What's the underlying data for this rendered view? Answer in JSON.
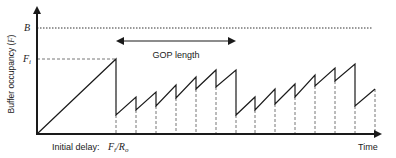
{
  "axes": {
    "y_label": "Buffer occupancy (F)",
    "x_label": "Time",
    "y_levels": [
      {
        "label": "B",
        "y": 28,
        "style": "dotted"
      },
      {
        "label": "Fi",
        "y": 59,
        "style": "dashed"
      }
    ]
  },
  "annotations": {
    "gop_label": "GOP length",
    "initial_delay_label": "Initial delay:",
    "initial_delay_value": "Fi/Ro"
  },
  "colors": {
    "line": "#1a1a1a",
    "dashed": "#777777",
    "text": "#222222"
  },
  "diagram": {
    "origin": [
      37,
      134
    ],
    "x_axis_end": 384,
    "y_axis_top": 5,
    "markers_x": [
      116,
      136,
      156,
      176,
      196,
      216,
      236,
      255,
      275,
      295,
      315,
      335,
      355,
      375
    ],
    "curve_points": [
      [
        37,
        134
      ],
      [
        116,
        59
      ],
      [
        116,
        115
      ],
      [
        136,
        97
      ],
      [
        136,
        110
      ],
      [
        156,
        92
      ],
      [
        156,
        106
      ],
      [
        176,
        85
      ],
      [
        176,
        98
      ],
      [
        196,
        77
      ],
      [
        196,
        89
      ],
      [
        216,
        70
      ],
      [
        216,
        87
      ],
      [
        236,
        70
      ],
      [
        236,
        115
      ],
      [
        255,
        97
      ],
      [
        255,
        110
      ],
      [
        275,
        89
      ],
      [
        275,
        104
      ],
      [
        295,
        84
      ],
      [
        295,
        97
      ],
      [
        315,
        75
      ],
      [
        315,
        86
      ],
      [
        335,
        68
      ],
      [
        335,
        81
      ],
      [
        355,
        64
      ],
      [
        355,
        106
      ],
      [
        375,
        89
      ]
    ]
  }
}
